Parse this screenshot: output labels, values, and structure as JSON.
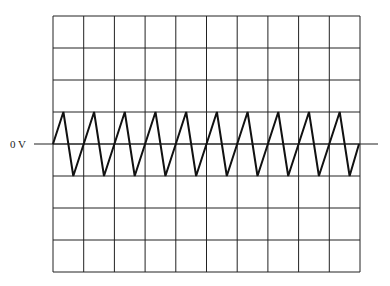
{
  "diagram": {
    "type": "oscilloscope-trace",
    "reference_label": "0 V",
    "grid": {
      "columns": 10,
      "rows": 8,
      "left": 53,
      "top": 16,
      "width": 307,
      "height": 256,
      "line_color": "#222222"
    },
    "baseline": {
      "y": 144,
      "x_start": 34,
      "x_end": 378
    },
    "waveform": {
      "shape": "sawtooth",
      "cycles": 10,
      "amplitude_divisions": 1,
      "period_divisions": 1,
      "rise_fraction": 0.68,
      "start_x": 53,
      "end_x": 359,
      "stroke_color": "#111111",
      "stroke_width": 2
    }
  }
}
